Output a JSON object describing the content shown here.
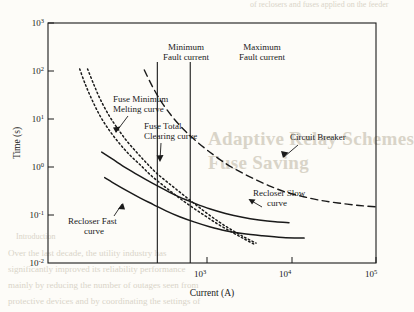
{
  "background_text": {
    "heading_line1": "Adaptive Relay Schemes",
    "heading_line2": "Fuse Saving",
    "section": "Introduction",
    "body_lines": [
      "Over the last decade, the utility industry has",
      "significantly improved its reliability performance",
      "mainly by reducing the number of outages seen from",
      "protective devices and by coordinating the settings of"
    ],
    "footer": "of reclosers and fuses applied on the feeder"
  },
  "chart_data": {
    "type": "line",
    "title": "",
    "xlabel": "Current (A)",
    "ylabel": "Time (s)",
    "xscale": "log",
    "yscale": "log",
    "xlim": [
      100,
      100000
    ],
    "ylim": [
      0.01,
      1000
    ],
    "grid": false,
    "legend_position": "inline-annotations",
    "x_ticks": [
      {
        "value": 1000,
        "label": "10",
        "exp": "3"
      },
      {
        "value": 10000,
        "label": "10",
        "exp": "4"
      },
      {
        "value": 100000,
        "label": "10",
        "exp": "5"
      }
    ],
    "y_ticks": [
      {
        "value": 1000,
        "label": "10",
        "exp": "3"
      },
      {
        "value": 100,
        "label": "10",
        "exp": "2"
      },
      {
        "value": 10,
        "label": "10",
        "exp": "1"
      },
      {
        "value": 1,
        "label": "10",
        "exp": "0"
      },
      {
        "value": 0.1,
        "label": "10",
        "exp": "-1"
      },
      {
        "value": 0.01,
        "label": "10",
        "exp": "-2"
      }
    ],
    "series": [
      {
        "name": "Fuse Minimum Melting curve",
        "style": "dotted",
        "points": [
          [
            230,
            110
          ],
          [
            260,
            55
          ],
          [
            300,
            26
          ],
          [
            360,
            12
          ],
          [
            430,
            6.5
          ],
          [
            520,
            3.6
          ],
          [
            650,
            2.0
          ],
          [
            800,
            1.2
          ],
          [
            1000,
            0.72
          ],
          [
            1300,
            0.44
          ],
          [
            1700,
            0.27
          ],
          [
            2200,
            0.17
          ],
          [
            2900,
            0.105
          ],
          [
            3800,
            0.068
          ],
          [
            5000,
            0.046
          ],
          [
            6500,
            0.033
          ],
          [
            8000,
            0.026
          ]
        ]
      },
      {
        "name": "Fuse Total Clearing curve",
        "style": "dotted",
        "points": [
          [
            195,
            110
          ],
          [
            220,
            52
          ],
          [
            255,
            24
          ],
          [
            300,
            11.5
          ],
          [
            360,
            6.0
          ],
          [
            440,
            3.3
          ],
          [
            550,
            1.85
          ],
          [
            700,
            1.1
          ],
          [
            880,
            0.66
          ],
          [
            1150,
            0.4
          ],
          [
            1500,
            0.25
          ],
          [
            2000,
            0.155
          ],
          [
            2700,
            0.098
          ],
          [
            3600,
            0.064
          ],
          [
            4800,
            0.044
          ],
          [
            6200,
            0.032
          ],
          [
            7600,
            0.025
          ]
        ]
      },
      {
        "name": "Circuit Breaker",
        "style": "dashed",
        "points": [
          [
            760,
            105
          ],
          [
            900,
            48
          ],
          [
            1100,
            22
          ],
          [
            1400,
            10.5
          ],
          [
            1800,
            5.6
          ],
          [
            2400,
            3.1
          ],
          [
            3200,
            1.85
          ],
          [
            4300,
            1.15
          ],
          [
            5800,
            0.78
          ],
          [
            8000,
            0.54
          ],
          [
            11000,
            0.39
          ],
          [
            15000,
            0.3
          ],
          [
            21000,
            0.245
          ],
          [
            30000,
            0.205
          ],
          [
            45000,
            0.178
          ],
          [
            70000,
            0.158
          ],
          [
            100000,
            0.148
          ]
        ]
      },
      {
        "name": "Recloser Slow curve",
        "style": "solid",
        "points": [
          [
            310,
            2.05
          ],
          [
            400,
            1.4
          ],
          [
            520,
            0.95
          ],
          [
            680,
            0.66
          ],
          [
            900,
            0.46
          ],
          [
            1200,
            0.325
          ],
          [
            1600,
            0.235
          ],
          [
            2200,
            0.175
          ],
          [
            3000,
            0.135
          ],
          [
            4200,
            0.108
          ],
          [
            6000,
            0.09
          ],
          [
            8500,
            0.079
          ],
          [
            12000,
            0.072
          ],
          [
            16000,
            0.069
          ]
        ]
      },
      {
        "name": "Recloser Fast curve",
        "style": "solid",
        "points": [
          [
            330,
            0.6
          ],
          [
            420,
            0.43
          ],
          [
            540,
            0.31
          ],
          [
            700,
            0.225
          ],
          [
            920,
            0.165
          ],
          [
            1200,
            0.122
          ],
          [
            1600,
            0.092
          ],
          [
            2200,
            0.071
          ],
          [
            3000,
            0.057
          ],
          [
            4200,
            0.047
          ],
          [
            6000,
            0.041
          ],
          [
            9000,
            0.037
          ],
          [
            14000,
            0.034
          ],
          [
            22000,
            0.033
          ]
        ]
      }
    ],
    "vertical_markers": [
      {
        "name": "Minimum Fault current",
        "value": 1000,
        "label_line1": "Minimum",
        "label_line2": "Fault current"
      },
      {
        "name": "Maximum Fault current",
        "value": 2000,
        "label_line1": "Maximum",
        "label_line2": "Fault current"
      }
    ],
    "annotations": [
      {
        "name": "fuse-minimum-melting-label",
        "line1": "Fuse Minimum",
        "line2": "Melting curve"
      },
      {
        "name": "fuse-total-clearing-label",
        "line1": "Fuse Total",
        "line2": "Clearing curve"
      },
      {
        "name": "circuit-breaker-label",
        "line1": "Circuit Breaker",
        "line2": ""
      },
      {
        "name": "recloser-slow-label",
        "line1": "Recloser Slow",
        "line2": "curve"
      },
      {
        "name": "recloser-fast-label",
        "line1": "Recloser Fast",
        "line2": "curve"
      }
    ]
  }
}
